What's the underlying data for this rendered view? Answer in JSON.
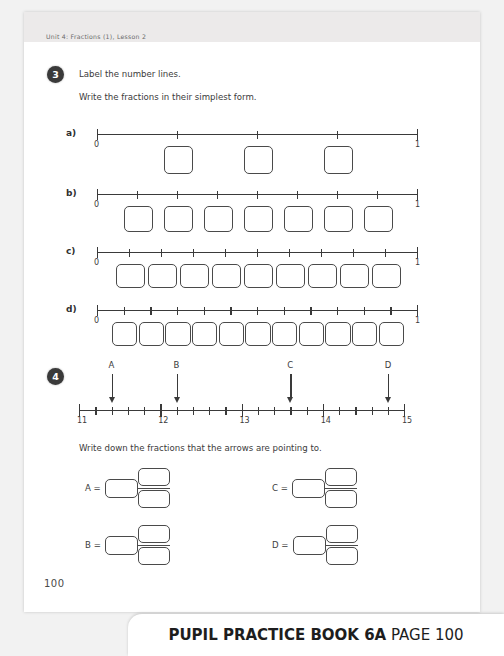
{
  "header": {
    "unit_text": "Unit 4: Fractions (1), Lesson 2"
  },
  "question3": {
    "number": "3",
    "instruction_1": "Label the number lines.",
    "instruction_2": "Write the fractions in their simplest form.",
    "lines": [
      {
        "label": "a)",
        "start_label": "0",
        "end_label": "1",
        "divisions": 4,
        "boxes": 3
      },
      {
        "label": "b)",
        "start_label": "0",
        "end_label": "1",
        "divisions": 8,
        "boxes": 7
      },
      {
        "label": "c)",
        "start_label": "0",
        "end_label": "1",
        "divisions": 10,
        "boxes": 9
      },
      {
        "label": "d)",
        "start_label": "0",
        "end_label": "1",
        "divisions": 12,
        "boxes": 11
      }
    ]
  },
  "question4": {
    "number": "4",
    "instruction": "Write down the fractions that the arrows are pointing to.",
    "axis": {
      "major_labels": [
        "11",
        "12",
        "13",
        "14",
        "15"
      ],
      "minor_per_unit": 5,
      "min": 11,
      "max": 15
    },
    "arrows": [
      {
        "letter": "A",
        "value": 11.4
      },
      {
        "letter": "B",
        "value": 12.2
      },
      {
        "letter": "C",
        "value": 13.6
      },
      {
        "letter": "D",
        "value": 14.8
      }
    ],
    "answers": [
      {
        "letter": "A ="
      },
      {
        "letter": "B ="
      },
      {
        "letter": "C ="
      },
      {
        "letter": "D ="
      }
    ]
  },
  "footer": {
    "page_number": "100",
    "banner_bold": "PUPIL PRACTICE BOOK 6A",
    "banner_page": "PAGE 100"
  }
}
